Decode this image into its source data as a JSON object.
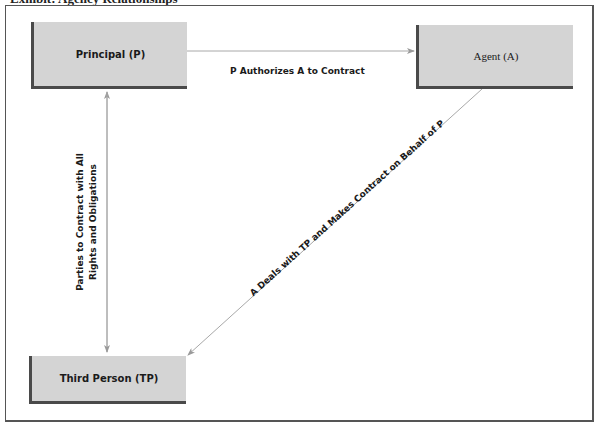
{
  "diagram": {
    "title": "Exhibit: Agency Relationships",
    "nodes": [
      {
        "id": "principal",
        "label": "Principal (P)"
      },
      {
        "id": "agent",
        "label": "Agent (A)"
      },
      {
        "id": "third_person",
        "label": "Third Person (TP)"
      }
    ],
    "edges": [
      {
        "from": "principal",
        "to": "agent",
        "label": "P Authorizes A to Contract",
        "direction": "one-way"
      },
      {
        "from": "principal",
        "to": "third_person",
        "label_line1": "Parties to Contract with All",
        "label_line2": "Rights and Obligations",
        "direction": "two-way"
      },
      {
        "from": "agent",
        "to": "third_person",
        "label": "A Deals with TP and Makes Contract on Behalf of P",
        "direction": "one-way"
      }
    ],
    "colors": {
      "box_fill": "#d4d4d4",
      "box_shadow": "#4a4a4a",
      "arrow": "#9a9a9a",
      "frame": "#555555"
    }
  }
}
